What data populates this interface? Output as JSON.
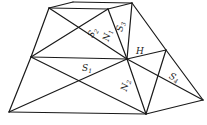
{
  "diagram": {
    "type": "geometry-frustum",
    "vertices": {
      "A": [
        49,
        8
      ],
      "B": [
        73,
        2
      ],
      "C": [
        132,
        3
      ],
      "D": [
        108,
        9
      ],
      "E": [
        31,
        57
      ],
      "F": [
        127,
        59
      ],
      "G": [
        166,
        50
      ],
      "I": [
        9,
        112
      ],
      "J": [
        146,
        114
      ],
      "K": [
        203,
        100
      ]
    },
    "edges": [
      [
        "A",
        "B"
      ],
      [
        "B",
        "C"
      ],
      [
        "A",
        "D"
      ],
      [
        "D",
        "C"
      ],
      [
        "A",
        "E"
      ],
      [
        "A",
        "F"
      ],
      [
        "D",
        "E"
      ],
      [
        "D",
        "F"
      ],
      [
        "C",
        "F"
      ],
      [
        "C",
        "G"
      ],
      [
        "G",
        "K"
      ],
      [
        "E",
        "F"
      ],
      [
        "F",
        "G"
      ],
      [
        "E",
        "I"
      ],
      [
        "E",
        "J"
      ],
      [
        "I",
        "F"
      ],
      [
        "I",
        "J"
      ],
      [
        "J",
        "K"
      ],
      [
        "F",
        "J"
      ],
      [
        "F",
        "K"
      ],
      [
        "G",
        "J"
      ]
    ],
    "labels": [
      {
        "id": "S2",
        "base": "S",
        "sub": "2",
        "x": 95,
        "y": 34,
        "rotate": -58
      },
      {
        "id": "N1",
        "base": "N",
        "sub": "1",
        "x": 110,
        "y": 36,
        "rotate": -75
      },
      {
        "id": "S3",
        "base": "S",
        "sub": "3",
        "x": 123,
        "y": 27,
        "rotate": -80
      },
      {
        "id": "H",
        "base": "H",
        "sub": "",
        "x": 140,
        "y": 54,
        "rotate": 0
      },
      {
        "id": "S1",
        "base": "S",
        "sub": "1",
        "x": 87,
        "y": 71,
        "rotate": 0
      },
      {
        "id": "N2",
        "base": "N",
        "sub": "2",
        "x": 128,
        "y": 86,
        "rotate": -75
      },
      {
        "id": "S4",
        "base": "S",
        "sub": "4",
        "x": 173,
        "y": 80,
        "rotate": 25
      }
    ]
  }
}
